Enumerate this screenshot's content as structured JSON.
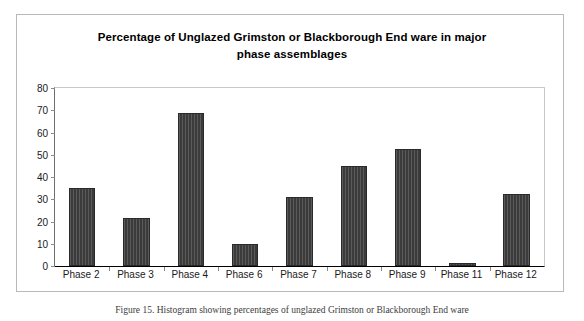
{
  "chart_data": {
    "type": "bar",
    "title": "Percentage of Unglazed Grimston or Blackborough End ware in major phase assemblages",
    "title_line1": "Percentage of Unglazed Grimston or Blackborough End ware in major",
    "title_line2": "phase assemblages",
    "xlabel": "",
    "ylabel": "",
    "categories": [
      "Phase 2",
      "Phase 3",
      "Phase 4",
      "Phase 6",
      "Phase 7",
      "Phase 8",
      "Phase 9",
      "Phase 11",
      "Phase 12"
    ],
    "values": [
      35,
      21.7,
      68.8,
      9.8,
      31,
      45,
      52.8,
      1.5,
      32.3
    ],
    "ylim": [
      0,
      80
    ],
    "yticks": [
      0,
      10,
      20,
      30,
      40,
      50,
      60,
      70,
      80
    ],
    "ytick_labels": [
      "0",
      "10",
      "20",
      "30",
      "40",
      "50",
      "60",
      "70",
      "80"
    ],
    "grid": false,
    "legend": false,
    "bar_color": "#3b3b3b",
    "plot_background": "#ffffff",
    "frame_color": "#b9b9b9"
  },
  "caption": {
    "text": "Figure 15. Histogram showing percentages of unglazed Grimston or Blackborough End ware"
  }
}
